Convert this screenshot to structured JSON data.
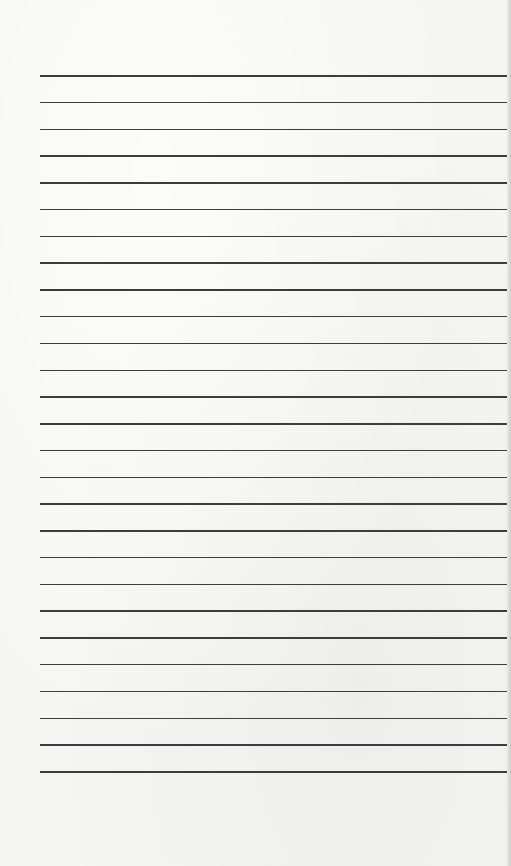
{
  "document": {
    "type": "lined-paper",
    "background_color": "#f5f5f3",
    "rule_color": "#3c3c3c",
    "rule_left_px": 40,
    "rule_right_px": 507,
    "first_rule_y_px": 75,
    "last_rule_y_px": 771,
    "rule_spacing_px": 26.77,
    "rule_count": 27,
    "lines": [
      {
        "index": 1,
        "text": ""
      },
      {
        "index": 2,
        "text": ""
      },
      {
        "index": 3,
        "text": ""
      },
      {
        "index": 4,
        "text": ""
      },
      {
        "index": 5,
        "text": ""
      },
      {
        "index": 6,
        "text": ""
      },
      {
        "index": 7,
        "text": ""
      },
      {
        "index": 8,
        "text": ""
      },
      {
        "index": 9,
        "text": ""
      },
      {
        "index": 10,
        "text": ""
      },
      {
        "index": 11,
        "text": ""
      },
      {
        "index": 12,
        "text": ""
      },
      {
        "index": 13,
        "text": ""
      },
      {
        "index": 14,
        "text": ""
      },
      {
        "index": 15,
        "text": ""
      },
      {
        "index": 16,
        "text": ""
      },
      {
        "index": 17,
        "text": ""
      },
      {
        "index": 18,
        "text": ""
      },
      {
        "index": 19,
        "text": ""
      },
      {
        "index": 20,
        "text": ""
      },
      {
        "index": 21,
        "text": ""
      },
      {
        "index": 22,
        "text": ""
      },
      {
        "index": 23,
        "text": ""
      },
      {
        "index": 24,
        "text": ""
      },
      {
        "index": 25,
        "text": ""
      },
      {
        "index": 26,
        "text": ""
      },
      {
        "index": 27,
        "text": ""
      }
    ]
  }
}
